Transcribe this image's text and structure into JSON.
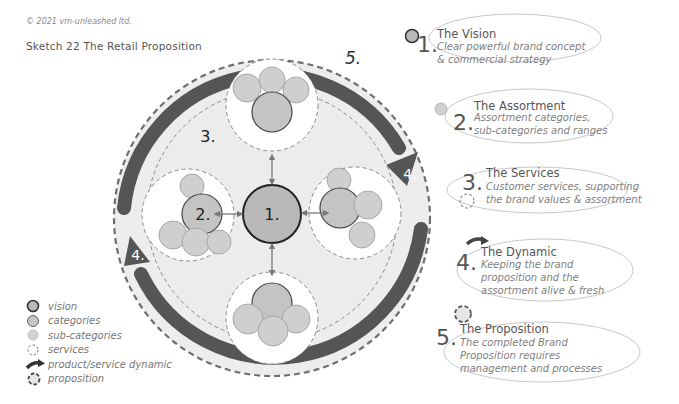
{
  "copyright": "© 2021 vm-unleashed ltd.",
  "title": "Sketch 22  The Retail Proposition",
  "colors": {
    "vision_fill": "#b9b9b9",
    "category_fill": "#c4c4c4",
    "subcategory_fill": "#cfcfcf",
    "dynamic_arrow": "#555555",
    "background_ring": "#ececec",
    "dashed_line": "#7a7a7a",
    "text": "#555555"
  },
  "diagram": {
    "center_label": "1.",
    "assortment_label": "2.",
    "services_label": "3.",
    "dynamic_label_right": "4.",
    "dynamic_label_left": "4.",
    "proposition_label": "5."
  },
  "legend": [
    {
      "icon": "vision-icon",
      "label": "vision"
    },
    {
      "icon": "categories-icon",
      "label": "categories"
    },
    {
      "icon": "sub-categories-icon",
      "label": "sub-categories"
    },
    {
      "icon": "services-icon",
      "label": "services"
    },
    {
      "icon": "dynamic-arrow-icon",
      "label": "product/service dynamic"
    },
    {
      "icon": "proposition-icon",
      "label": "proposition"
    }
  ],
  "cards": [
    {
      "num": "1.",
      "heading": "The Vision",
      "lines": [
        "Clear powerful brand concept",
        "& commercial strategy"
      ],
      "icon": "vision-icon"
    },
    {
      "num": "2.",
      "heading": "The Assortment",
      "lines": [
        "Assortment categories,",
        "sub-categories and ranges"
      ],
      "icon": "sub-categories-icon"
    },
    {
      "num": "3.",
      "heading": "The Services",
      "lines": [
        "Customer services, supporting",
        "the brand values & assortment"
      ],
      "icon": "services-icon"
    },
    {
      "num": "4.",
      "heading": "The Dynamic",
      "lines": [
        "Keeping the brand",
        "proposition and the",
        "assortment alive & fresh"
      ],
      "icon": "dynamic-arrow-icon"
    },
    {
      "num": "5.",
      "heading": "The Proposition",
      "lines": [
        "The completed Brand",
        "Proposition requires",
        "management and  processes"
      ],
      "icon": "proposition-icon"
    }
  ]
}
